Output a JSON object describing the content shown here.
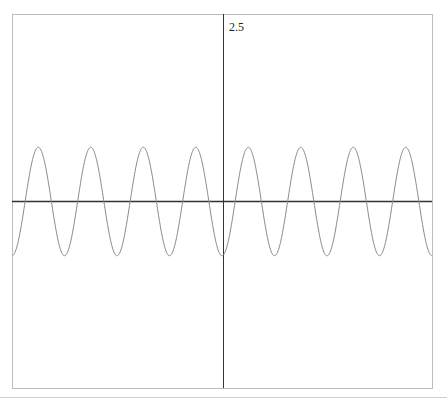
{
  "chart_data": {
    "type": "line",
    "title": "",
    "xlabel": "",
    "ylabel": "",
    "function": "y = -A*cos(k*x)",
    "periods_visible": 8,
    "amplitude_relative_to_ymax": 0.29,
    "ylim": [
      -2.5,
      2.5
    ],
    "y_tick_labels": [
      "2.5"
    ],
    "x_axis_position": "center",
    "y_axis_position": "center",
    "grid": false,
    "legend": "none",
    "series": [
      {
        "name": "wave",
        "color": "#8a8a8a",
        "style": "thin line",
        "peaks": 8,
        "troughs_at": [
          "left-edge",
          "center",
          "right-edge"
        ]
      }
    ]
  },
  "plot": {
    "frame_color": "#bdbdbd",
    "axis_color": "#333333",
    "curve_color": "#8a8a8a",
    "y_max_label": "2.5"
  }
}
